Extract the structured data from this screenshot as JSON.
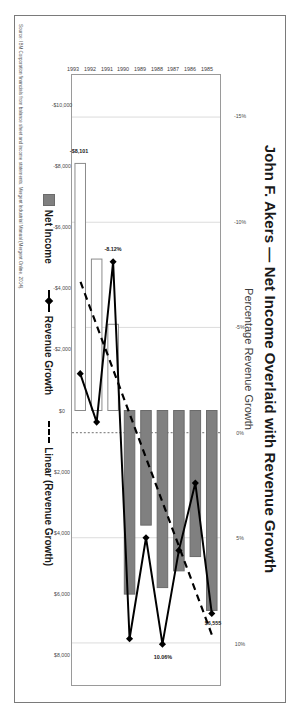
{
  "document": {
    "source_note": "Source: IBM Corporation financials from balance sheet and income statements, Mergent Industrial Manual (Mergent Online, 2014)."
  },
  "legend": {
    "items": [
      {
        "label": "Net Income",
        "marker": "filled-square-swatch",
        "color": "#808080"
      },
      {
        "label": "Revenue Growth",
        "marker": "solid-line-diamond-marker",
        "color": "#000000"
      },
      {
        "label": "Linear (Revenue Growth)",
        "marker": "dashed-line",
        "color": "#000000"
      }
    ]
  },
  "chart_data": {
    "type": "bar",
    "title": "John F. Akers — Net Income Overlaid with Revenue Growth",
    "subtitle": "",
    "xlabel": "",
    "ylabel": "Percentage Revenue Growth",
    "secondary_axis_label": "",
    "grid": true,
    "legend_position": "bottom",
    "orientation": "rotated-90-clockwise",
    "categories": [
      "1985",
      "1986",
      "1987",
      "1988",
      "1989",
      "1990",
      "1991",
      "1992",
      "1993"
    ],
    "series": [
      {
        "name": "Net Income",
        "type": "bar",
        "axis": "dollars",
        "unit": "$ millions",
        "values": [
          6555,
          4789,
          5258,
          5806,
          3758,
          6020,
          -2827,
          -4965,
          -8101
        ]
      },
      {
        "name": "Revenue Growth",
        "type": "line",
        "axis": "percent",
        "unit": "%",
        "values": [
          8.6,
          2.4,
          5.6,
          10.06,
          5.0,
          9.8,
          -8.12,
          -0.5,
          -2.8
        ]
      },
      {
        "name": "Linear (Revenue Growth)",
        "type": "trendline-dashed",
        "axis": "percent",
        "unit": "%",
        "values": [
          9.6,
          7.5,
          5.4,
          3.3,
          1.2,
          -0.9,
          -3.0,
          -5.1,
          -7.2
        ]
      }
    ],
    "data_labels": [
      {
        "text": "$6,555",
        "series": "Net Income",
        "category": "1985"
      },
      {
        "text": "10.06%",
        "series": "Revenue Growth",
        "category": "1988"
      },
      {
        "text": "-8.12%",
        "series": "Revenue Growth",
        "category": "1991"
      },
      {
        "text": "-$8,101",
        "series": "Net Income",
        "category": "1993"
      }
    ],
    "percent_axis": {
      "ticks": [
        "-15%",
        "-10%",
        "-5%",
        "0%",
        "5%",
        "10%"
      ],
      "values": [
        -15,
        -10,
        -5,
        0,
        5,
        10
      ],
      "ylim": [
        -17,
        12
      ]
    },
    "dollar_axis": {
      "ticks": [
        "-$10,000",
        "-$8,000",
        "-$6,000",
        "-$4,000",
        "-$2,000",
        "$0",
        "$2,000",
        "$4,000",
        "$6,000",
        "$8,000"
      ],
      "values": [
        -10000,
        -8000,
        -6000,
        -4000,
        -2000,
        0,
        2000,
        4000,
        6000,
        8000
      ],
      "ylim": [
        -11000,
        9000
      ]
    }
  }
}
